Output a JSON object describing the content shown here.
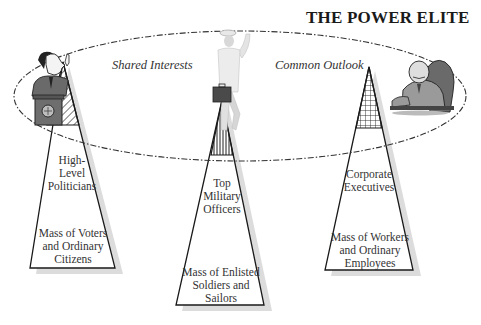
{
  "title": "THE POWER ELITE",
  "ellipse_labels": {
    "left": "Shared Interests",
    "right": "Common Outlook"
  },
  "pyramids": [
    {
      "name": "political",
      "figure": "politician-at-podium",
      "top_pattern": "diagonal-hatch",
      "top_label": "High-\nLevel\nPoliticians",
      "bottom_label": "Mass of Voters\nand Ordinary\nCitizens"
    },
    {
      "name": "military",
      "figure": "military-officer-with-briefcase",
      "top_pattern": "vertical-lines",
      "top_label": "Top\nMilitary\nOfficers",
      "bottom_label": "Mass of Enlisted\nSoldiers and\nSailors"
    },
    {
      "name": "corporate",
      "figure": "executive-in-armchair",
      "top_pattern": "grid",
      "top_label": "Corporate\nExecutives",
      "bottom_label": "Mass of Workers\nand Ordinary\nEmployees"
    }
  ],
  "colors": {
    "line": "#1a1a1a",
    "shadow": "#d9d9d9",
    "figure_dark": "#555555",
    "figure_mid": "#888888",
    "figure_light": "#cfcfcf"
  }
}
